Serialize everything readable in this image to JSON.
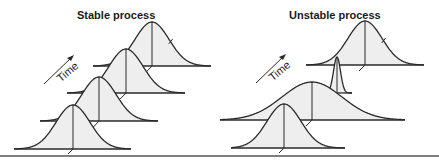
{
  "panels": [
    {
      "title": "Stable process",
      "time_label": "Time",
      "distributions": [
        {
          "center_x": 73,
          "baseline_y": 149,
          "sigma": 17,
          "height": 44,
          "x_start": 14,
          "x_end": 131
        },
        {
          "center_x": 99,
          "baseline_y": 121,
          "sigma": 17,
          "height": 44,
          "x_start": 40,
          "x_end": 158
        },
        {
          "center_x": 126,
          "baseline_y": 93,
          "sigma": 17,
          "height": 44,
          "x_start": 67,
          "x_end": 185
        },
        {
          "center_x": 152,
          "baseline_y": 66,
          "sigma": 17,
          "height": 44,
          "x_start": 93,
          "x_end": 211
        }
      ]
    },
    {
      "title": "Unstable process",
      "time_label": "Time",
      "distributions": [
        {
          "center_x": 284,
          "baseline_y": 148,
          "sigma": 17,
          "height": 44,
          "x_start": 231,
          "x_end": 345
        },
        {
          "center_x": 312,
          "baseline_y": 120,
          "sigma": 30,
          "height": 38,
          "x_start": 220,
          "x_end": 405
        },
        {
          "center_x": 337,
          "baseline_y": 93,
          "sigma": 3.5,
          "height": 36,
          "x_start": 326,
          "x_end": 352
        },
        {
          "center_x": 365,
          "baseline_y": 65,
          "sigma": 17,
          "height": 44,
          "x_start": 306,
          "x_end": 424
        }
      ]
    }
  ],
  "colors": {
    "line": "#2a2a2a",
    "fill": "#eeeeee",
    "rule": "#555555"
  }
}
